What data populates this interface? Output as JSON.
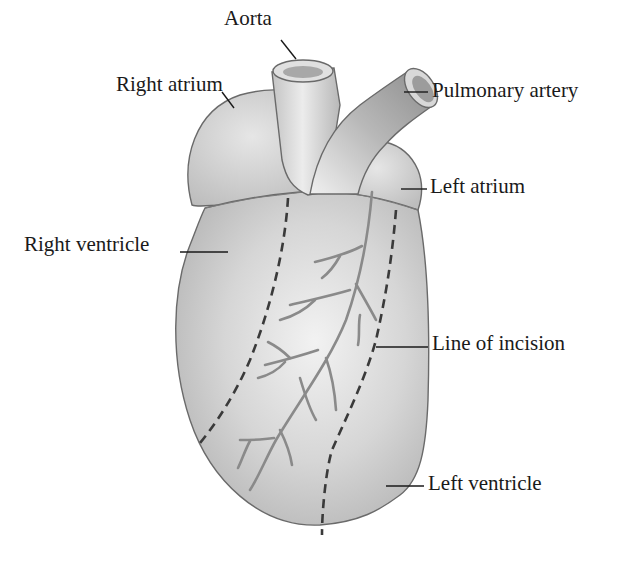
{
  "diagram": {
    "type": "anatomical-illustration",
    "labels": [
      {
        "id": "aorta",
        "text": "Aorta"
      },
      {
        "id": "pulmonary-artery",
        "text": "Pulmonary artery"
      },
      {
        "id": "right-atrium",
        "text": "Right atrium"
      },
      {
        "id": "left-atrium",
        "text": "Left atrium"
      },
      {
        "id": "right-ventricle",
        "text": "Right ventricle"
      },
      {
        "id": "line-of-incision",
        "text": "Line of incision"
      },
      {
        "id": "left-ventricle",
        "text": "Left ventricle"
      }
    ],
    "colors": {
      "fill_light": "#e8e8e8",
      "fill_mid": "#c8c8c8",
      "fill_dark": "#a0a0a0",
      "outline": "#6a6a6a",
      "vessel": "#8a8a8a",
      "incision": "#3a3a3a",
      "text": "#1a1a1a"
    }
  }
}
